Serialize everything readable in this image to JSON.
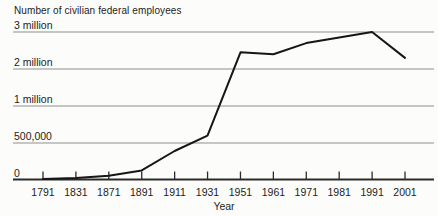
{
  "chart_data": {
    "type": "line",
    "title": "Number of civilian federal employees",
    "xlabel": "Year",
    "ylabel": "Number of civilian federal employees",
    "x_tick_labels": [
      "1791",
      "1831",
      "1871",
      "1891",
      "1911",
      "1931",
      "1951",
      "1961",
      "1971",
      "1981",
      "1991",
      "2001"
    ],
    "x_tick_years": [
      1791,
      1831,
      1871,
      1891,
      1911,
      1931,
      1951,
      1961,
      1971,
      1981,
      1991,
      2001
    ],
    "y_tick_labels": [
      "3 million",
      "2 million",
      "1 million",
      "500,000",
      "0"
    ],
    "y_tick_values": [
      3000000,
      2000000,
      1000000,
      500000,
      0
    ],
    "y_scale_note": "gridlines evenly spaced although intervals are unequal (nonlinear value scale)",
    "grid": "horizontal-only",
    "legend": "none",
    "series": [
      {
        "name": "Civilian federal employees",
        "points": [
          [
            1791,
            5000
          ],
          [
            1831,
            20000
          ],
          [
            1871,
            50000
          ],
          [
            1891,
            125000
          ],
          [
            1911,
            390000
          ],
          [
            1931,
            600000
          ],
          [
            1951,
            2450000
          ],
          [
            1961,
            2400000
          ],
          [
            1971,
            2700000
          ],
          [
            1981,
            2850000
          ],
          [
            1991,
            3000000
          ],
          [
            2001,
            2300000
          ]
        ]
      }
    ],
    "colors": {
      "line": "#161616",
      "gridline": "#8f8f8f",
      "axis": "#2b2b2b",
      "text": "#1c1c1c",
      "background": "#fcfcfa"
    }
  }
}
